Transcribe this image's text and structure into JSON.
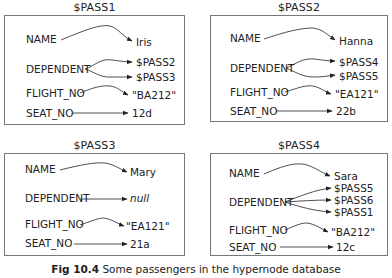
{
  "figure": {
    "caption_label": "Fig 10.4",
    "caption_text": "Some passengers in the hypernode database"
  },
  "nodes": [
    {
      "title": "$PASS1",
      "attributes": [
        {
          "name": "NAME",
          "values": [
            "Iris"
          ]
        },
        {
          "name": "DEPENDENT",
          "values": [
            "$PASS2",
            "$PASS3"
          ]
        },
        {
          "name": "FLIGHT_NO",
          "values": [
            "\"BA212\""
          ]
        },
        {
          "name": "SEAT_NO",
          "values": [
            "12d"
          ]
        }
      ]
    },
    {
      "title": "$PASS2",
      "attributes": [
        {
          "name": "NAME",
          "values": [
            "Hanna"
          ]
        },
        {
          "name": "DEPENDENT",
          "values": [
            "$PASS4",
            "$PASS5"
          ]
        },
        {
          "name": "FLIGHT_NO",
          "values": [
            "\"EA121\""
          ]
        },
        {
          "name": "SEAT_NO",
          "values": [
            "22b"
          ]
        }
      ]
    },
    {
      "title": "$PASS3",
      "attributes": [
        {
          "name": "NAME",
          "values": [
            "Mary"
          ]
        },
        {
          "name": "DEPENDENT",
          "values": [
            "null"
          ]
        },
        {
          "name": "FLIGHT_NO",
          "values": [
            "\"EA121\""
          ]
        },
        {
          "name": "SEAT_NO",
          "values": [
            "21a"
          ]
        }
      ]
    },
    {
      "title": "$PASS4",
      "attributes": [
        {
          "name": "NAME",
          "values": [
            "Sara"
          ]
        },
        {
          "name": "DEPENDENT",
          "values": [
            "$PASS5",
            "$PASS6",
            "$PASS1"
          ]
        },
        {
          "name": "FLIGHT_NO",
          "values": [
            "\"BA212\""
          ]
        },
        {
          "name": "SEAT_NO",
          "values": [
            "12c"
          ]
        }
      ]
    }
  ]
}
